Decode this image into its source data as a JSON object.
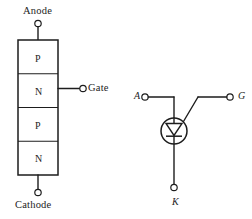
{
  "figure": {
    "background_color": "#ffffff",
    "line_color": "#1d1d1d"
  },
  "structure_diagram": {
    "name": "four-layer-pnpn-structure",
    "layers": [
      {
        "id": "p1",
        "label": "P"
      },
      {
        "id": "n1",
        "label": "N"
      },
      {
        "id": "p2",
        "label": "P"
      },
      {
        "id": "n2",
        "label": "N"
      }
    ],
    "terminals": {
      "anode": {
        "label": "Anode",
        "position": "top"
      },
      "cathode": {
        "label": "Cathode",
        "position": "bottom"
      },
      "gate": {
        "label": "Gate",
        "position": "right",
        "attached_layer": "n1"
      }
    }
  },
  "symbol_diagram": {
    "name": "scr-circuit-symbol",
    "shape": "circle-with-downward-triangle-and-bar",
    "terminals": {
      "anode": {
        "label": "A",
        "position": "left"
      },
      "gate": {
        "label": "G",
        "position": "upper-right"
      },
      "cathode": {
        "label": "K",
        "position": "bottom"
      }
    }
  }
}
